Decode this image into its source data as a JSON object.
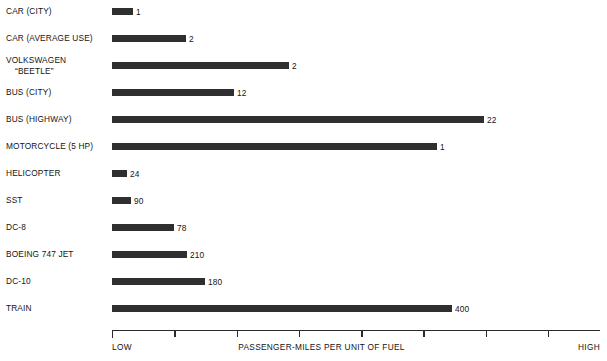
{
  "chart_data": {
    "type": "bar",
    "orientation": "horizontal",
    "title": "",
    "xlabel": "PASSENGER-MILES PER UNIT OF FUEL",
    "ylabel": "",
    "axis_low_label": "LOW",
    "axis_high_label": "HIGH",
    "grid": false,
    "legend": "none",
    "tick_count": 8,
    "categories": [
      "CAR (CITY)",
      "CAR (AVERAGE USE)",
      "VOLKSWAGEN “BEETLE”",
      "BUS (CITY)",
      "BUS (HIGHWAY)",
      "MOTORCYCLE (5 HP)",
      "HELICOPTER",
      "SST",
      "DC-8",
      "BOEING 747 JET",
      "DC-10",
      "TRAIN"
    ],
    "values": [
      1,
      2,
      2,
      12,
      22,
      1,
      24,
      90,
      78,
      210,
      180,
      400
    ],
    "value_labels": [
      "1",
      "2",
      "2",
      "12",
      "22",
      "1",
      "24",
      "90",
      "78",
      "210",
      "180",
      "400"
    ]
  },
  "rows": [
    {
      "label_line1": "CAR (CITY)",
      "label_line2": "",
      "value_label": "1",
      "bar_px": 21
    },
    {
      "label_line1": "CAR (AVERAGE USE)",
      "label_line2": "",
      "value_label": "2",
      "bar_px": 74
    },
    {
      "label_line1": "VOLKSWAGEN",
      "label_line2": "“BEETLE”",
      "value_label": "2",
      "bar_px": 177
    },
    {
      "label_line1": "BUS (CITY)",
      "label_line2": "",
      "value_label": "12",
      "bar_px": 122
    },
    {
      "label_line1": "BUS (HIGHWAY)",
      "label_line2": "",
      "value_label": "22",
      "bar_px": 372
    },
    {
      "label_line1": "MOTORCYCLE (5 HP)",
      "label_line2": "",
      "value_label": "1",
      "bar_px": 325
    },
    {
      "label_line1": "HELICOPTER",
      "label_line2": "",
      "value_label": "24",
      "bar_px": 15
    },
    {
      "label_line1": "SST",
      "label_line2": "",
      "value_label": "90",
      "bar_px": 19
    },
    {
      "label_line1": "DC-8",
      "label_line2": "",
      "value_label": "78",
      "bar_px": 62
    },
    {
      "label_line1": "BOEING 747 JET",
      "label_line2": "",
      "value_label": "210",
      "bar_px": 75
    },
    {
      "label_line1": "DC-10",
      "label_line2": "",
      "value_label": "180",
      "bar_px": 93
    },
    {
      "label_line1": "TRAIN",
      "label_line2": "",
      "value_label": "400",
      "bar_px": 340
    }
  ],
  "axis": {
    "low": "LOW",
    "high": "HIGH",
    "title": "PASSENGER-MILES PER UNIT OF FUEL"
  },
  "colors": {
    "bar": "#2f2f2f",
    "axis": "#2b2b2b",
    "text": "#141414",
    "background": "#ffffff"
  }
}
